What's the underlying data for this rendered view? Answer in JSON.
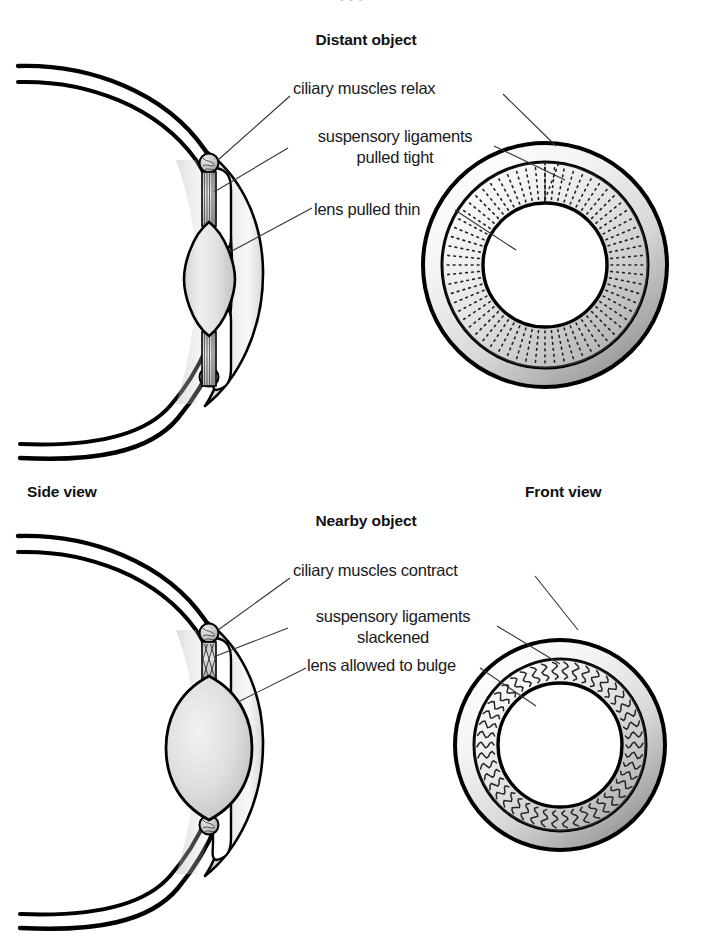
{
  "figure": {
    "background_color": "#ffffff",
    "ink_color": "#000000",
    "leader_line_color": "#333333"
  },
  "column_captions": {
    "side_view": "Side view",
    "front_view": "Front view"
  },
  "panels": [
    {
      "id": "distant",
      "title": "Distant object",
      "labels": {
        "muscles": "ciliary muscles relax",
        "ligaments_line1": "suspensory ligaments",
        "ligaments_line2": "pulled tight",
        "lens": "lens pulled thin"
      },
      "front_view": {
        "ligament_style": "straight-radial-dotted",
        "pupil_size": "small"
      },
      "side_view": {
        "lens_shape": "thin-elongated",
        "ligament_state": "taut-straight"
      }
    },
    {
      "id": "nearby",
      "title": "Nearby object",
      "labels": {
        "muscles": "ciliary muscles contract",
        "ligaments_line1": "suspensory ligaments",
        "ligaments_line2": "slackened",
        "lens": "lens allowed to bulge"
      },
      "front_view": {
        "ligament_style": "wavy-slack",
        "pupil_size": "large"
      },
      "side_view": {
        "lens_shape": "round-bulging",
        "ligament_state": "slack-wavy"
      }
    }
  ],
  "cropped_header": "· · ·"
}
